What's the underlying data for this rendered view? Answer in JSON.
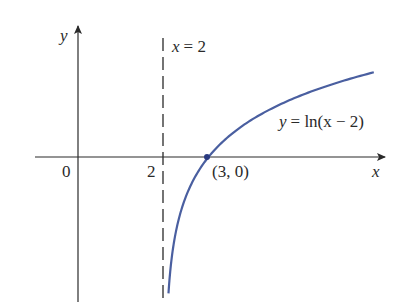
{
  "chart_data": {
    "type": "line",
    "title": "",
    "xlabel": "x",
    "ylabel": "y",
    "series": [
      {
        "name": "y = ln(x − 2)",
        "function": "ln(x-2)",
        "color": "#4a5fa0",
        "x": [
          2.08,
          2.2,
          2.5,
          3,
          3.5,
          4,
          5,
          6,
          6.8
        ],
        "values": [
          -2.53,
          -1.61,
          -0.69,
          0,
          0.41,
          0.69,
          1.1,
          1.39,
          1.57
        ]
      }
    ],
    "asymptote": {
      "label_lhs": "x",
      "label_rhs": "= 2",
      "x": 2,
      "style": "dashed"
    },
    "marked_point": {
      "label": "(3, 0)",
      "x": 3,
      "y": 0
    },
    "tick_labels": {
      "origin": "0",
      "x_two": "2"
    },
    "curve_label": {
      "lhs": "y",
      "rhs": "= ln(x − 2)"
    },
    "axis_labels": {
      "x": "x",
      "y": "y"
    },
    "grid": false,
    "legend": "none"
  }
}
